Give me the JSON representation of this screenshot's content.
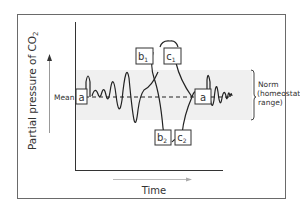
{
  "diagram": {
    "y_axis_label_main": "Partial pressure of CO",
    "y_axis_label_sub": "2",
    "x_axis_label": "Time",
    "mean_label": "Mean",
    "norm_label_lines": [
      "Norm",
      "(homeostatic",
      "range)"
    ],
    "boxes": {
      "a_left": "a",
      "a_right": "a",
      "b1_main": "b",
      "b1_sub": "1",
      "c1_main": "c",
      "c1_sub": "1",
      "b2_main": "b",
      "b2_sub": "2",
      "c2_main": "c",
      "c2_sub": "2"
    },
    "colors": {
      "frame": "#555555",
      "band": "#efefef",
      "curve": "#222222",
      "arrow": "#9a9a9a"
    }
  }
}
